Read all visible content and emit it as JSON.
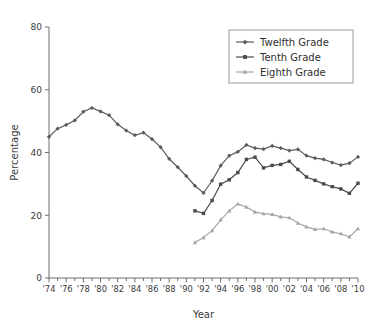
{
  "chart_data": {
    "type": "line",
    "title": "",
    "xlabel": "Year",
    "ylabel": "Percentage",
    "xlim": [
      1974,
      2010
    ],
    "ylim": [
      0,
      80
    ],
    "yticks": [
      0,
      20,
      40,
      60,
      80
    ],
    "xticks": [
      "'74",
      "'76",
      "'78",
      "'80",
      "'82",
      "'84",
      "'86",
      "'88",
      "'90",
      "'92",
      "'94",
      "'96",
      "'98",
      "'00",
      "'02",
      "'04",
      "'06",
      "'08",
      "'10"
    ],
    "xtick_values": [
      1974,
      1976,
      1978,
      1980,
      1982,
      1984,
      1986,
      1988,
      1990,
      1992,
      1994,
      1996,
      1998,
      2000,
      2002,
      2004,
      2006,
      2008,
      2010
    ],
    "minor_xticks": [
      1975,
      1977,
      1979,
      1981,
      1983,
      1985,
      1987,
      1989,
      1991,
      1993,
      1995,
      1997,
      1999,
      2001,
      2003,
      2005,
      2007,
      2009
    ],
    "grid": false,
    "legend_position": "top-right",
    "series": [
      {
        "name": "Twelfth Grade",
        "marker": "diamond",
        "color": "#5c5c5c",
        "x": [
          1974,
          1975,
          1976,
          1977,
          1978,
          1979,
          1980,
          1981,
          1982,
          1983,
          1984,
          1985,
          1986,
          1987,
          1988,
          1989,
          1990,
          1991,
          1992,
          1993,
          1994,
          1995,
          1996,
          1997,
          1998,
          1999,
          2000,
          2001,
          2002,
          2003,
          2004,
          2005,
          2006,
          2007,
          2008,
          2009,
          2010
        ],
        "values": [
          45.0,
          47.6,
          48.8,
          50.2,
          53.0,
          54.2,
          53.1,
          51.9,
          49.0,
          47.0,
          45.5,
          46.3,
          44.3,
          41.7,
          38.0,
          35.3,
          32.5,
          29.4,
          27.1,
          31.0,
          35.8,
          39.0,
          40.2,
          42.4,
          41.4,
          41.1,
          42.1,
          41.4,
          40.6,
          41.0,
          39.0,
          38.2,
          37.8,
          36.8,
          36.0,
          36.6,
          38.6
        ]
      },
      {
        "name": "Tenth Grade",
        "marker": "square",
        "color": "#4a4a4a",
        "x": [
          1991,
          1992,
          1993,
          1994,
          1995,
          1996,
          1997,
          1998,
          1999,
          2000,
          2001,
          2002,
          2003,
          2004,
          2005,
          2006,
          2007,
          2008,
          2009,
          2010
        ],
        "values": [
          21.4,
          20.6,
          24.7,
          29.9,
          31.3,
          33.6,
          37.8,
          38.5,
          35.1,
          35.9,
          36.2,
          37.2,
          34.6,
          32.2,
          31.1,
          30.0,
          29.1,
          28.4,
          27.0,
          30.2
        ]
      },
      {
        "name": "Eighth Grade",
        "marker": "triangle",
        "color": "#a6a6a6",
        "x": [
          1991,
          1992,
          1993,
          1994,
          1995,
          1996,
          1997,
          1998,
          1999,
          2000,
          2001,
          2002,
          2003,
          2004,
          2005,
          2006,
          2007,
          2008,
          2009,
          2010
        ],
        "values": [
          11.3,
          12.9,
          15.1,
          18.5,
          21.4,
          23.6,
          22.6,
          21.0,
          20.5,
          20.3,
          19.5,
          19.2,
          17.5,
          16.3,
          15.5,
          15.7,
          14.7,
          14.1,
          13.1,
          15.7
        ]
      }
    ],
    "legend": [
      {
        "label": "Twelfth Grade",
        "marker": "diamond",
        "color": "#5c5c5c"
      },
      {
        "label": "Tenth Grade",
        "marker": "square",
        "color": "#4a4a4a"
      },
      {
        "label": "Eighth Grade",
        "marker": "triangle",
        "color": "#a6a6a6"
      }
    ]
  }
}
